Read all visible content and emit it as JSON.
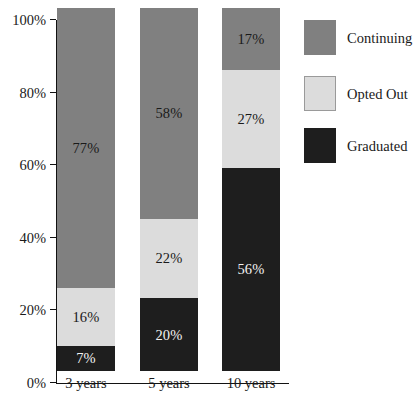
{
  "chart_data": {
    "type": "bar",
    "stacked": true,
    "stack_total": 100,
    "title": "",
    "subtitle": "",
    "xlabel": "",
    "ylabel": "",
    "categories": [
      "3 years",
      "5 years",
      "10 years"
    ],
    "ylim": [
      0,
      100
    ],
    "ytick_labels": [
      "0%",
      "20%",
      "40%",
      "60%",
      "80%",
      "100%"
    ],
    "ytick_values": [
      0,
      20,
      40,
      60,
      80,
      100
    ],
    "grid": false,
    "legend_position": "right",
    "series": [
      {
        "name": "Graduated",
        "color": "#1e1e1e",
        "label_color": "#f2f2f2",
        "values": [
          7,
          20,
          56
        ],
        "data_labels": [
          "7%",
          "20%",
          "56%"
        ]
      },
      {
        "name": "Opted Out",
        "color": "#dcdcdc",
        "label_color": "#1a1a1a",
        "values": [
          16,
          22,
          27
        ],
        "data_labels": [
          "16%",
          "22%",
          "27%"
        ]
      },
      {
        "name": "Continuing",
        "color": "#808080",
        "label_color": "#1a1a1a",
        "values": [
          77,
          58,
          17
        ],
        "data_labels": [
          "77%",
          "58%",
          "17%"
        ]
      }
    ]
  },
  "legend": {
    "entries": [
      {
        "label": "Continuing",
        "color": "#808080"
      },
      {
        "label": "Opted Out",
        "color": "#dcdcdc"
      },
      {
        "label": "Graduated",
        "color": "#1e1e1e"
      }
    ]
  },
  "axis": {
    "y_ticks": [
      {
        "label": "100%",
        "value": 100
      },
      {
        "label": "80%",
        "value": 80
      },
      {
        "label": "60%",
        "value": 60
      },
      {
        "label": "40%",
        "value": 40
      },
      {
        "label": "20%",
        "value": 20
      },
      {
        "label": "0%",
        "value": 0
      }
    ],
    "x_labels": [
      "3 years",
      "5 years",
      "10 years"
    ]
  },
  "caption": {
    "text": ""
  }
}
